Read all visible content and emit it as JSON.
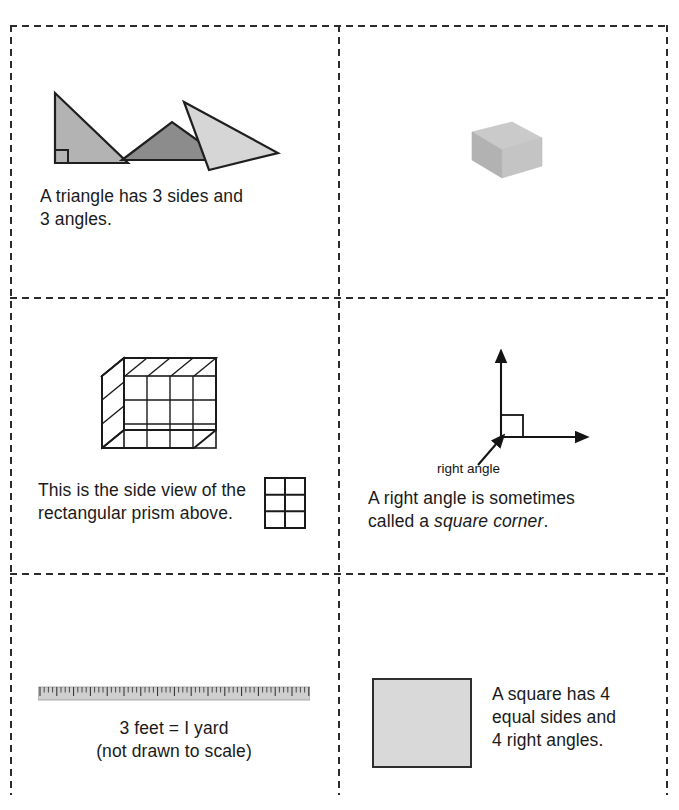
{
  "page": {
    "layout": "3 rows x 2 columns of dashed cut-out cards"
  },
  "colors": {
    "cut_line": "#2b2b2b",
    "text": "#1a1a1a",
    "triangle_left": "#b3b3b3",
    "triangle_middle": "#8c8c8c",
    "triangle_right": "#d6d6d6",
    "prism_top": "#c9c9c9",
    "prism_front": "#b4b4b4",
    "prism_side": "#c2c2c2",
    "square_fill": "#d9d9d9",
    "ruler_body": "#cfcfcf",
    "outline": "#2e2e2e"
  },
  "cards": [
    {
      "id": "triangles",
      "figure": "three-triangles",
      "caption": "A triangle has 3 sides and\n3 angles."
    },
    {
      "id": "prism",
      "figure": "rectangular-prism-3d",
      "caption": ""
    },
    {
      "id": "cube",
      "figure": "unit-cube-stack",
      "caption": "This is the side view of the\nrectangular prism above.",
      "side_view": {
        "columns": 2,
        "rows": 3
      },
      "cube_grid": {
        "front_columns": 4,
        "front_rows": 3,
        "depth": 1
      }
    },
    {
      "id": "rightangle",
      "figure": "right-angle-rays",
      "annotation": "right angle",
      "caption_prefix": "A right angle is sometimes\ncalled a ",
      "caption_italic": "square corner",
      "caption_suffix": "."
    },
    {
      "id": "ruler",
      "figure": "ruler",
      "caption_line1": "3 feet  =  I yard",
      "caption_line2": "(not drawn to scale)"
    },
    {
      "id": "square",
      "figure": "shaded-square",
      "caption": "A square has 4\nequal sides and\n4 right angles."
    }
  ]
}
